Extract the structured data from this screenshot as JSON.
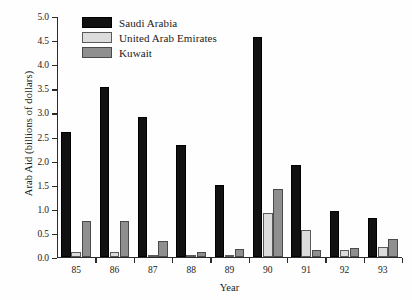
{
  "chart_data": {
    "type": "bar",
    "title": "",
    "xlabel": "Year",
    "ylabel": "Arab Aid (billions of dollars)",
    "categories": [
      "85",
      "86",
      "87",
      "88",
      "89",
      "90",
      "91",
      "92",
      "93"
    ],
    "series": [
      {
        "name": "Saudi Arabia",
        "color": "#111111",
        "values": [
          2.6,
          3.52,
          2.9,
          2.33,
          1.48,
          4.56,
          1.9,
          0.95,
          0.8
        ]
      },
      {
        "name": "United Arab Emirates",
        "color": "#dcdcdc",
        "values": [
          0.1,
          0.1,
          0.02,
          0.02,
          0.03,
          0.9,
          0.55,
          0.15,
          0.2
        ]
      },
      {
        "name": "Kuwait",
        "color": "#8f8f8f",
        "values": [
          0.75,
          0.75,
          0.32,
          0.1,
          0.17,
          1.4,
          0.15,
          0.18,
          0.38
        ]
      }
    ],
    "ylim": [
      0.0,
      5.0
    ],
    "yticks": [
      "0.0",
      "0.5",
      "1.0",
      "1.5",
      "2.0",
      "2.5",
      "3.0",
      "3.5",
      "4.0",
      "4.5",
      "5.0"
    ],
    "ytick_values": [
      0.0,
      0.5,
      1.0,
      1.5,
      2.0,
      2.5,
      3.0,
      3.5,
      4.0,
      4.5,
      5.0
    ],
    "grid": false,
    "legend_position": "top-left"
  }
}
